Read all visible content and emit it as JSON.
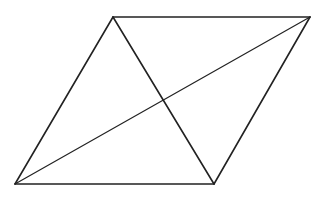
{
  "diagram": {
    "type": "parallelogram-with-diagonals",
    "stroke_color": "#222222",
    "background": "#ffffff",
    "vertices": {
      "top_left": [
        113,
        17
      ],
      "top_right": [
        310,
        17
      ],
      "bottom_right": [
        214,
        184
      ],
      "bottom_left": [
        15,
        184
      ]
    },
    "edges": [
      {
        "name": "top-edge",
        "from": "top_left",
        "to": "top_right",
        "width": 1.6
      },
      {
        "name": "right-edge",
        "from": "top_right",
        "to": "bottom_right",
        "width": 1.6
      },
      {
        "name": "bottom-edge",
        "from": "bottom_right",
        "to": "bottom_left",
        "width": 1.6
      },
      {
        "name": "left-edge",
        "from": "bottom_left",
        "to": "top_left",
        "width": 1.6
      }
    ],
    "diagonals": [
      {
        "name": "diagonal-short",
        "from": "top_left",
        "to": "bottom_right",
        "width": 1.6
      },
      {
        "name": "diagonal-long",
        "from": "bottom_left",
        "to": "top_right",
        "width": 1.2
      }
    ],
    "intersection": [
      163,
      100
    ]
  }
}
